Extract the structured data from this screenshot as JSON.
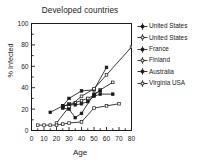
{
  "chart_data": {
    "type": "line",
    "title": "Developed countries",
    "xlabel": "Age",
    "ylabel": "% Infected",
    "xlim": [
      0,
      80
    ],
    "ylim": [
      0,
      100
    ],
    "xticks": [
      0,
      10,
      20,
      30,
      40,
      50,
      60,
      70,
      80
    ],
    "yticks": [
      0,
      20,
      40,
      60,
      80,
      100
    ],
    "xtick_labels": [
      "0",
      "10",
      "20",
      "30",
      "40",
      "50",
      "60",
      "70",
      "80"
    ],
    "ytick_labels": [
      "0",
      "20",
      "40",
      "60",
      "80",
      "100"
    ],
    "grid": false,
    "legend_position": "right",
    "line_color": "#1a1a1a",
    "background": "#ffffff",
    "series": [
      {
        "name": "United States",
        "marker": "plus-line",
        "x": [
          15,
          25,
          30,
          40,
          50,
          60
        ],
        "y": [
          17,
          23,
          30,
          37,
          38,
          59
        ]
      },
      {
        "name": "United States",
        "marker": "plus-line",
        "x": [
          25,
          30,
          35,
          40,
          45,
          50,
          55,
          65
        ],
        "y": [
          22,
          25,
          26,
          28,
          30,
          33,
          38,
          45
        ]
      },
      {
        "name": "France",
        "marker": "plus-line",
        "x": [
          25,
          30,
          35,
          40,
          45,
          50,
          55,
          65
        ],
        "y": [
          23,
          24,
          24,
          25,
          27,
          32,
          34,
          34
        ]
      },
      {
        "name": "Finland",
        "marker": "plus-line",
        "x": [
          20,
          30,
          40,
          50,
          60,
          80
        ],
        "y": [
          7,
          22,
          32,
          39,
          52,
          78
        ]
      },
      {
        "name": "Australia",
        "marker": "plus-line",
        "x": [
          25,
          30,
          35,
          40,
          50,
          55
        ],
        "y": [
          21,
          20,
          12,
          16,
          34,
          37
        ]
      },
      {
        "name": "Virginia USA",
        "marker": "plus-line",
        "x": [
          5,
          10,
          15,
          20,
          25,
          30,
          40,
          50,
          60,
          70
        ],
        "y": [
          5,
          5,
          5,
          5,
          6,
          7,
          8,
          21,
          23,
          25
        ]
      }
    ]
  },
  "legend": {
    "entries": [
      {
        "label": "United States"
      },
      {
        "label": "United States"
      },
      {
        "label": "France"
      },
      {
        "label": "Finland"
      },
      {
        "label": "Australia"
      },
      {
        "label": "Virginia USA"
      }
    ]
  }
}
